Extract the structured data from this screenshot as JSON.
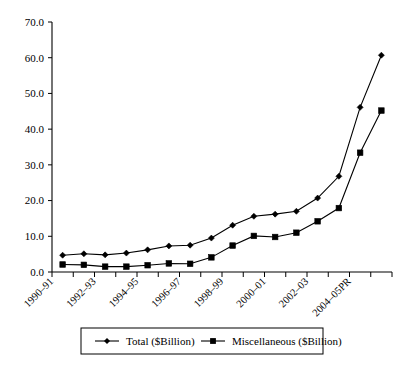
{
  "chart_data": {
    "type": "line",
    "title": "",
    "xlabel": "",
    "ylabel": "",
    "ylim": [
      0.0,
      70.0
    ],
    "ytick_step": 10.0,
    "grid": false,
    "legend_position": "bottom",
    "ytick_labels": [
      "0.0",
      "10.0",
      "20.0",
      "30.0",
      "40.0",
      "50.0",
      "60.0",
      "70.0"
    ],
    "ytick_values": [
      0.0,
      10.0,
      20.0,
      30.0,
      40.0,
      50.0,
      60.0,
      70.0
    ],
    "x": [
      "1990-91",
      "1991-92",
      "1992-93",
      "1993-94",
      "1994-95",
      "1995-96",
      "1996-97",
      "1997-98",
      "1998-99",
      "1999-00",
      "2000-01",
      "2001-02",
      "2002-03",
      "2003-04",
      "2004-05PR",
      "2005-06PR"
    ],
    "xtick_labels": [
      "1990–91",
      "1992–93",
      "1994–95",
      "1996–97",
      "1998–99",
      "2000–01",
      "2002–03",
      "2004–05PR"
    ],
    "xtick_label_indices": [
      0,
      2,
      4,
      6,
      8,
      10,
      12,
      14
    ],
    "xtick_label_rotation": -45,
    "series": [
      {
        "name": "Total ($Billion)",
        "marker": "diamond",
        "color": "#000000",
        "values": [
          4.7,
          5.1,
          4.8,
          5.3,
          6.2,
          7.3,
          7.5,
          9.5,
          13.1,
          15.6,
          16.2,
          17.0,
          20.7,
          26.8,
          46.1,
          60.7
        ]
      },
      {
        "name": "Miscellaneous ($Billion)",
        "marker": "square",
        "color": "#000000",
        "values": [
          2.1,
          2.0,
          1.5,
          1.5,
          1.9,
          2.4,
          2.3,
          4.1,
          7.4,
          10.1,
          9.8,
          11.0,
          14.2,
          17.9,
          33.4,
          45.2
        ]
      }
    ]
  },
  "legend": {
    "items": [
      {
        "label": "Total ($Billion)",
        "marker": "diamond-marker-icon"
      },
      {
        "label": "Miscellaneous ($Billion)",
        "marker": "square-marker-icon"
      }
    ]
  }
}
